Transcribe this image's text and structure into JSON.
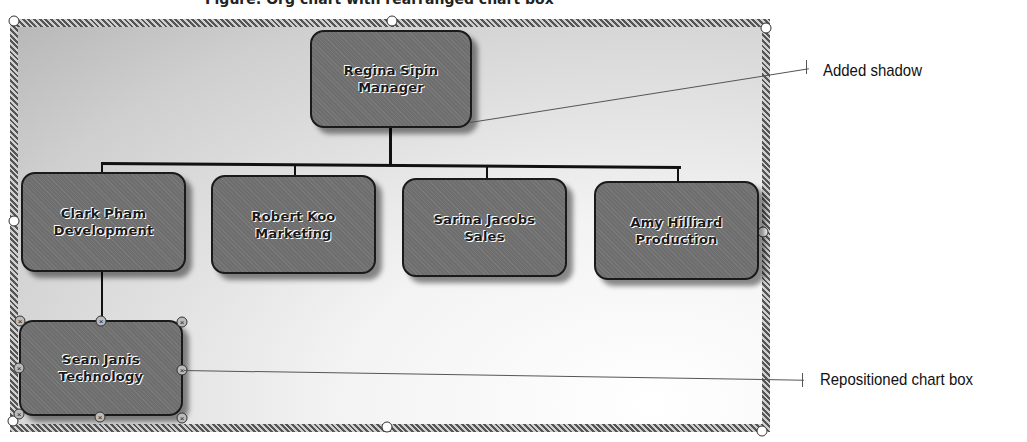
{
  "caption": {
    "text": "Figure: Org chart with rearranged chart box"
  },
  "chart": {
    "manager": {
      "name": "Regina Sipin",
      "title": "Manager"
    },
    "reports": [
      {
        "name": "Clark Pham",
        "title": "Development"
      },
      {
        "name": "Robert Koo",
        "title": "Marketing"
      },
      {
        "name": "Sarina Jacobs",
        "title": "Sales"
      },
      {
        "name": "Amy Hilliard",
        "title": "Production"
      }
    ],
    "subordinate": {
      "name": "Sean Janis",
      "title": "Technology"
    }
  },
  "callouts": [
    {
      "label": "Added shadow"
    },
    {
      "label": "Repositioned chart box"
    }
  ],
  "colors": {
    "box_fill": "#6e6e6e",
    "box_border": "#1a1a1a",
    "frame_border": "#8a8a8a",
    "background": "#ffffff"
  }
}
